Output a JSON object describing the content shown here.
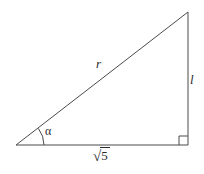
{
  "figure": {
    "background_color": "#ffffff",
    "stroke_color": "#4a4a4a",
    "label_color": "#2b2b2b",
    "stroke_width": 1,
    "geometry": {
      "left_vertex": [
        16,
        145
      ],
      "right_angle_vertex": [
        188,
        145
      ],
      "apex_vertex": [
        188,
        12
      ],
      "angle_arc_radius": 28,
      "right_angle_marker_size": 9
    },
    "labels": {
      "hypotenuse": "r",
      "vertical_leg": "l",
      "angle": "α",
      "base_sign": "√",
      "base_radicand": "5"
    }
  }
}
